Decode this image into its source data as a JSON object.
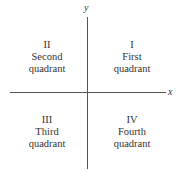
{
  "axes": {
    "x_label": "x",
    "y_label": "y"
  },
  "quadrants": [
    {
      "numeral": "I",
      "name": "First",
      "word": "quadrant"
    },
    {
      "numeral": "II",
      "name": "Second",
      "word": "quadrant"
    },
    {
      "numeral": "III",
      "name": "Third",
      "word": "quadrant"
    },
    {
      "numeral": "IV",
      "name": "Fourth",
      "word": "quadrant"
    }
  ],
  "colors": {
    "axis": "#555555",
    "text": "#333333"
  }
}
